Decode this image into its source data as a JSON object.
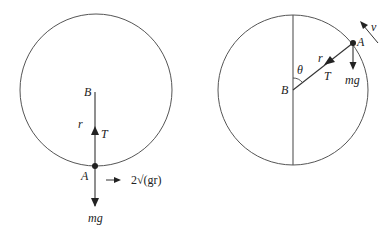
{
  "figure": {
    "left_diagram": {
      "circle": {
        "cx": 96,
        "cy": 90,
        "r": 76
      },
      "point_A": {
        "label": "A",
        "x": 95,
        "y": 166
      },
      "point_B": {
        "label": "B",
        "x": 95,
        "y": 92
      },
      "radius_label": "r",
      "tension_label": "T",
      "weight_label": "mg",
      "velocity_label": "2√(gr)"
    },
    "right_diagram": {
      "circle": {
        "cx": 293,
        "cy": 90,
        "r": 75
      },
      "point_A": {
        "label": "A",
        "x": 353,
        "y": 43
      },
      "point_B": {
        "label": "B",
        "x": 293,
        "y": 90
      },
      "angle_label": "θ",
      "radius_label": "r",
      "tension_label": "T",
      "weight_label": "mg",
      "velocity_label": "v"
    },
    "colors": {
      "stroke": "#333333",
      "text": "#222222",
      "background": "#ffffff"
    }
  }
}
